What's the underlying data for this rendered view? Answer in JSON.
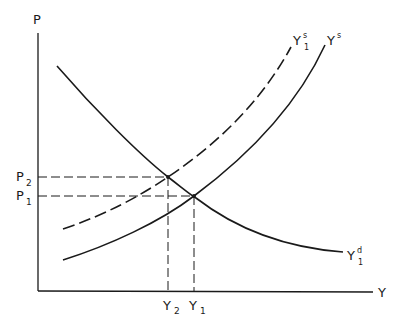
{
  "diagram": {
    "type": "supply-demand",
    "colors": {
      "ink": "#1a1a1a",
      "background": "#ffffff"
    },
    "axes": {
      "y_label": "P",
      "x_label": "Y"
    },
    "price_ticks": [
      {
        "main": "P",
        "sub": "2"
      },
      {
        "main": "P",
        "sub": "1"
      }
    ],
    "quantity_ticks": [
      {
        "main": "Y",
        "sub": "2"
      },
      {
        "main": "Y",
        "sub": "1"
      }
    ],
    "curves": {
      "demand": {
        "main": "Y",
        "sup": "d",
        "sub": "1",
        "style": "solid"
      },
      "supply_shifted": {
        "main": "Y",
        "sup": "s",
        "sub": "1",
        "style": "dashed"
      },
      "supply": {
        "main": "Y",
        "sup": "s",
        "style": "solid"
      }
    }
  }
}
